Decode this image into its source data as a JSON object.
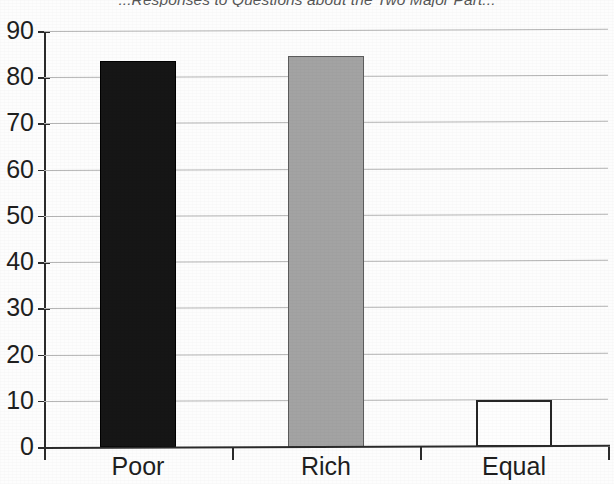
{
  "chart_data": {
    "type": "bar",
    "title": "...Responses to Questions about the Two Major Part...",
    "xlabel": "",
    "ylabel": "",
    "categories": [
      "Poor",
      "Rich",
      "Equal"
    ],
    "values": [
      83.5,
      84.5,
      10.2
    ],
    "series": [
      {
        "name": "Percent of responses",
        "values": [
          83.5,
          84.5,
          10.2
        ]
      }
    ],
    "ylim": [
      0,
      90
    ],
    "yticks": [
      0,
      10,
      20,
      30,
      40,
      50,
      60,
      70,
      80,
      90
    ],
    "ytick_labels": [
      "0",
      "10",
      "20",
      "30",
      "40",
      "50",
      "60",
      "70",
      "80",
      "90"
    ],
    "grid": true,
    "legend": false,
    "legend_position": "none",
    "bar_colors": [
      "#161616",
      "#a3a3a3",
      "#fefefe"
    ],
    "bar_edge_colors": [
      "#000000",
      "#5c5c5c",
      "#262626"
    ],
    "background_color": "#fdfdfd",
    "gridline_color": "#b4b4b4",
    "axis_color": "#2b2b2b",
    "text_color": "#1f1f1f"
  }
}
